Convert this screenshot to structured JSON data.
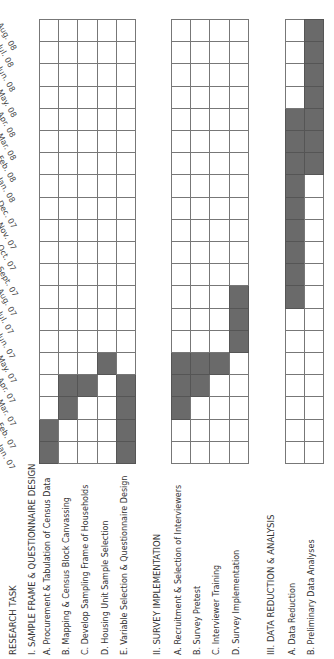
{
  "chart_data": {
    "type": "gantt",
    "title": "",
    "orientation": "rotated 90deg counter-clockwise (time axis runs bottom-to-top)",
    "column_header": "RESEARCH TASK",
    "months": [
      "Jan. 07",
      "Feb. 07",
      "Mar. 07",
      "Apr. 07",
      "May. 07",
      "Jun. 07",
      "Jul. 07",
      "Aug. 07",
      "Sept. 07",
      "Oct. 07",
      "Nov. 07",
      "Dec. 07",
      "Jan. 08",
      "Feb. 08",
      "Mar. 08",
      "Apr. 08",
      "May. 08",
      "Jun. 08",
      "Jul. 08",
      "Aug. 08"
    ],
    "sections": [
      {
        "label": "I.  SAMPLE FRAME & QUESTIONNAIRE DESIGN",
        "tasks": [
          {
            "label": "A.  Procurement & Tabulation of Census Data",
            "start": "Jan. 07",
            "end": "Feb. 07",
            "active": [
              0,
              1
            ]
          },
          {
            "label": "B.  Mapping & Census Block Canvassing",
            "start": "Mar. 07",
            "end": "Apr. 07",
            "active": [
              2,
              3
            ]
          },
          {
            "label": "C.  Develop Sampling Frame of Households",
            "start": "Apr. 07",
            "end": "Apr. 07",
            "active": [
              3
            ]
          },
          {
            "label": "D.  Housing Unit Sample Selection",
            "start": "May. 07",
            "end": "May. 07",
            "active": [
              4
            ]
          },
          {
            "label": "E.  Variable Selection & Questionnaire Design",
            "start": "Jan. 07",
            "end": "Apr. 07",
            "active": [
              0,
              1,
              2,
              3
            ]
          }
        ]
      },
      {
        "label": "II. SURVEY IMPLEMENTATION",
        "tasks": [
          {
            "label": "A.  Recruitment & Selection of Interviewers",
            "start": "Mar. 07",
            "end": "May. 07",
            "active": [
              2,
              3,
              4
            ]
          },
          {
            "label": "B.  Survey Pretest",
            "start": "Apr. 07",
            "end": "May. 07",
            "active": [
              3,
              4
            ]
          },
          {
            "label": "C.  Interviewer Training",
            "start": "May. 07",
            "end": "May. 07",
            "active": [
              4
            ]
          },
          {
            "label": "D.  Survey Implementation",
            "start": "Jun. 07",
            "end": "Aug. 07",
            "active": [
              5,
              6,
              7
            ]
          }
        ]
      },
      {
        "label": "III. DATA REDUCTION & ANALYSIS",
        "tasks": [
          {
            "label": "A. Data Reduction",
            "start": "Aug. 07",
            "end": "Apr. 08",
            "active": [
              7,
              8,
              9,
              10,
              11,
              12,
              13,
              14,
              15
            ]
          },
          {
            "label": "B. Preliminary Data Analyses",
            "start": "Feb. 08",
            "end": "Aug. 08",
            "active": [
              13,
              14,
              15,
              16,
              17,
              18,
              19
            ]
          }
        ]
      }
    ],
    "colors": {
      "active": "#6a6a6a",
      "inactive": "#ffffff",
      "grid": "#777777"
    },
    "grid": true,
    "legend": null
  }
}
